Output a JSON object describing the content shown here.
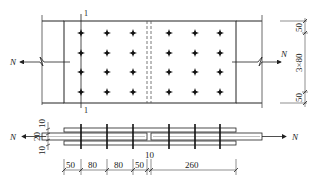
{
  "diagram": {
    "type": "bolted-splice-connection",
    "colors": {
      "line": "#222222",
      "hidden": "#555555",
      "background": "#ffffff"
    },
    "force_label": "N",
    "section_label": "1",
    "plan_view": {
      "bolt_rows": 4,
      "bolt_columns_per_side": 3,
      "right_dimensions": {
        "top": "50",
        "middle": "3×80",
        "bottom": "50"
      }
    },
    "side_view": {
      "left_dimensions": {
        "top": "10",
        "middle": "20",
        "bottom": "10"
      },
      "bottom_dimensions": [
        "50",
        "80",
        "80",
        "50",
        "10",
        "260"
      ]
    }
  }
}
